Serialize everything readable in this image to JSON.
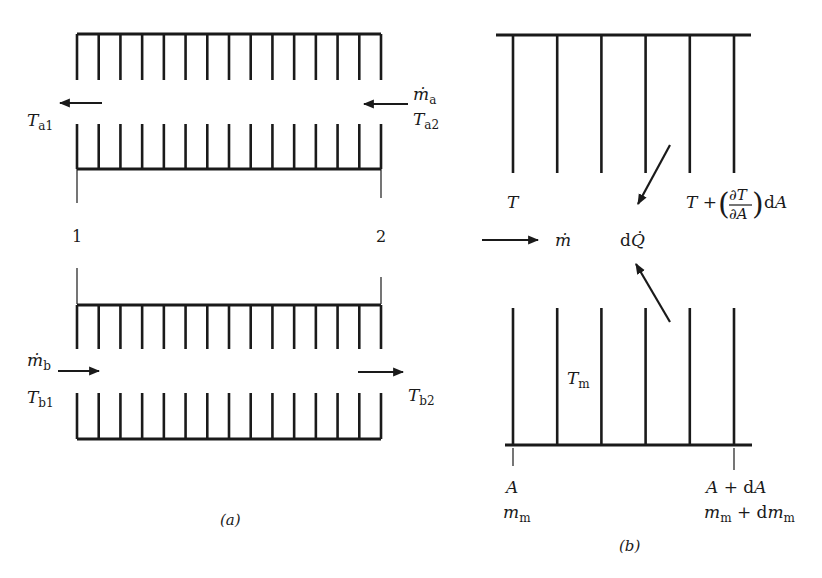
{
  "figure": {
    "colors": {
      "ink": "#1a1a1a",
      "background": "#ffffff"
    },
    "panel_a": {
      "caption": "(a)",
      "station_labels": [
        "1",
        "2"
      ],
      "fluid_a": {
        "mass_flow_symbol": "ṁ",
        "mass_flow_sub": "a",
        "inlet_temp_symbol": "T",
        "inlet_temp_sub": "a2",
        "outlet_temp_symbol": "T",
        "outlet_temp_sub": "a1",
        "flow_direction": "right-to-left"
      },
      "fluid_b": {
        "mass_flow_symbol": "ṁ",
        "mass_flow_sub": "b",
        "inlet_temp_symbol": "T",
        "inlet_temp_sub": "b1",
        "outlet_temp_symbol": "T",
        "outlet_temp_sub": "b2",
        "flow_direction": "left-to-right"
      },
      "fins_per_row": 15
    },
    "panel_b": {
      "caption": "(b)",
      "temp_left": "T",
      "temp_right_prefix": "T + ",
      "temp_right_partial_num": "∂T",
      "temp_right_partial_den": "∂A",
      "temp_right_suffix": "dA",
      "mass_flow": "ṁ",
      "heat_prefix": "d",
      "heat_symbol": "Q̇",
      "matrix_temp_symbol": "T",
      "matrix_temp_sub": "m",
      "left_area": "A",
      "left_mass_symbol": "m",
      "left_mass_sub": "m",
      "right_area": "A + dA",
      "right_mass_symbol": "m",
      "right_mass_sub": "m",
      "right_mass_mid": " + dm",
      "right_mass_sub2": "m",
      "fins_per_row": 6
    }
  }
}
